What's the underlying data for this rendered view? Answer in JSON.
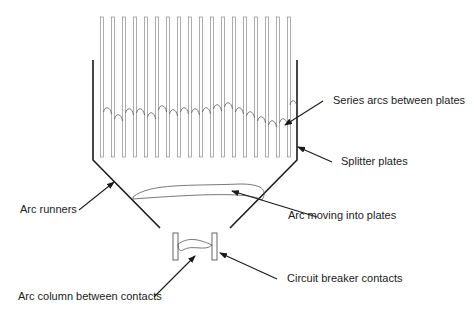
{
  "diagram": {
    "type": "arc chute schematic",
    "labels": {
      "series_arcs": "Series arcs between plates",
      "splitter_plates": "Splitter plates",
      "arc_runners": "Arc runners",
      "arc_moving": "Arc moving into plates",
      "breaker_contacts": "Circuit breaker contacts",
      "arc_column": "Arc column between contacts"
    },
    "plates": {
      "count": 18,
      "first_x": 102,
      "spacing": 11,
      "top_y": 17,
      "bottom_y": 157
    },
    "colors": {
      "line": "#1a1a1a",
      "plate": "#8a8a8a",
      "text": "#222222"
    }
  }
}
